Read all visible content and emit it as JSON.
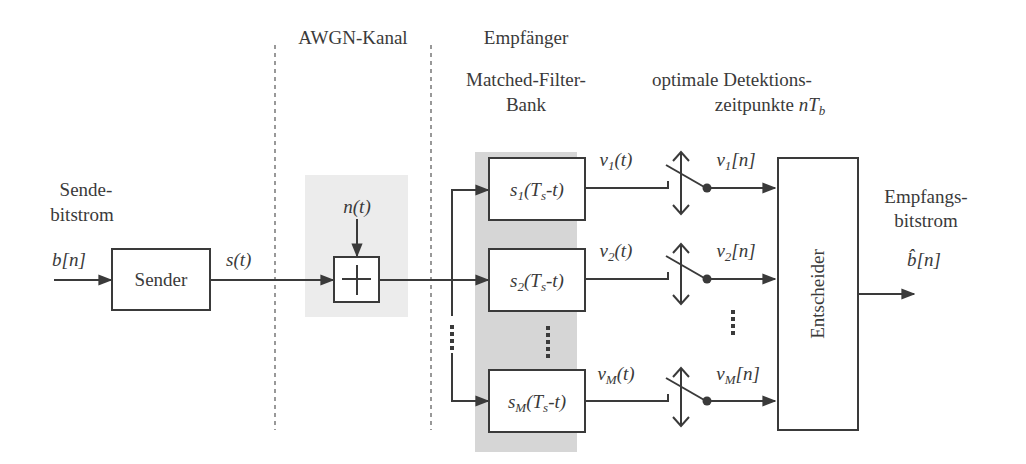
{
  "sections": {
    "channel": "AWGN-Kanal",
    "receiver": "Empfänger",
    "filterbank_line1": "Matched-Filter-",
    "filterbank_line2": "Bank",
    "sampling_line1": "optimale Detektions-",
    "sampling_line2_text": "zeitpunkte ",
    "sampling_line2_math": "nT",
    "sampling_line2_sub": "b"
  },
  "input": {
    "label_line1": "Sende-",
    "label_line2": "bitstrom",
    "signal": "b[n]"
  },
  "sender": {
    "label": "Sender",
    "output_signal": "s(t)"
  },
  "noise": {
    "signal": "n(t)",
    "adder_symbol": "+"
  },
  "filters": [
    {
      "name": "s",
      "sub": "1",
      "arg": "(T",
      "arg_sub": "s",
      "arg_end": "-t)",
      "out": "v",
      "out_sub": "1",
      "out_arg": "(t)",
      "sample": "v",
      "sample_sub": "1",
      "sample_arg": "[n]"
    },
    {
      "name": "s",
      "sub": "2",
      "arg": "(T",
      "arg_sub": "s",
      "arg_end": "-t)",
      "out": "v",
      "out_sub": "2",
      "out_arg": "(t)",
      "sample": "v",
      "sample_sub": "2",
      "sample_arg": "[n]"
    },
    {
      "name": "s",
      "sub": "M",
      "arg": "(T",
      "arg_sub": "s",
      "arg_end": "-t)",
      "out": "v",
      "out_sub": "M",
      "out_arg": "(t)",
      "sample": "v",
      "sample_sub": "M",
      "sample_arg": "[n]"
    }
  ],
  "decision": {
    "label": "Entscheider"
  },
  "output": {
    "label_line1": "Empfangs-",
    "label_line2": "bitstrom",
    "signal_hat": "b̂",
    "signal_rest": "[n]"
  },
  "colors": {
    "line": "#3a3a3a",
    "shade_channel": "#ececec",
    "shade_filterbank": "#d4d4d4"
  }
}
